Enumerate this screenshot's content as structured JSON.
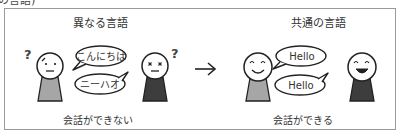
{
  "header": {
    "cut_caption": "の言語)"
  },
  "left_panel": {
    "title": "異なる言語",
    "bubble_top": "こんにちは",
    "bubble_bottom": "ニーハオ",
    "caption": "会話ができない",
    "left_person": {
      "expression": "confused",
      "shirt_color": "#a6a6a6",
      "symbol": "?"
    },
    "right_person": {
      "expression": "x-eyes",
      "shirt_color": "#3d3d3d",
      "symbol": "?"
    }
  },
  "arrow": {
    "glyph": "→"
  },
  "right_panel": {
    "title": "共通の言語",
    "bubble_top": "Hello",
    "bubble_bottom": "Hello",
    "caption": "会話ができる",
    "left_person": {
      "expression": "smile",
      "shirt_color": "#a6a6a6"
    },
    "right_person": {
      "expression": "laugh",
      "shirt_color": "#3d3d3d"
    }
  }
}
